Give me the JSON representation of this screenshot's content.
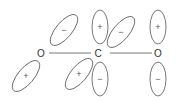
{
  "diagram": {
    "atoms": [
      {
        "id": "o-left",
        "label": "O",
        "x": 41,
        "y": 53
      },
      {
        "id": "c-center",
        "label": "C",
        "x": 98,
        "y": 53
      },
      {
        "id": "o-right",
        "label": "O",
        "x": 158,
        "y": 53
      }
    ],
    "bonds": [
      {
        "x1": 49,
        "y1": 53,
        "x2": 91,
        "y2": 53
      },
      {
        "x1": 110,
        "y1": 53,
        "x2": 152,
        "y2": 53
      }
    ],
    "lobes": [
      {
        "id": "o-left-upper",
        "sign": "−",
        "cx": 64,
        "cy": 30,
        "rx": 8,
        "ry": 19,
        "rot": 40
      },
      {
        "id": "o-left-lower",
        "sign": "+",
        "cx": 26,
        "cy": 76,
        "rx": 8,
        "ry": 19,
        "rot": 40
      },
      {
        "id": "c-upper-vertical",
        "sign": "+",
        "cx": 100,
        "cy": 27,
        "rx": 8,
        "ry": 17,
        "rot": 0
      },
      {
        "id": "c-lower-vertical",
        "sign": "−",
        "cx": 100,
        "cy": 79,
        "rx": 8,
        "ry": 17,
        "rot": 0
      },
      {
        "id": "c-upper-tilted",
        "sign": "−",
        "cx": 121,
        "cy": 32,
        "rx": 8,
        "ry": 19,
        "rot": 40
      },
      {
        "id": "c-lower-tilted",
        "sign": "+",
        "cx": 79,
        "cy": 74,
        "rx": 8,
        "ry": 19,
        "rot": 40
      },
      {
        "id": "o-right-upper",
        "sign": "+",
        "cx": 158,
        "cy": 27,
        "rx": 8,
        "ry": 17,
        "rot": 0
      },
      {
        "id": "o-right-lower",
        "sign": "−",
        "cx": 158,
        "cy": 79,
        "rx": 8,
        "ry": 17,
        "rot": 0
      }
    ]
  }
}
